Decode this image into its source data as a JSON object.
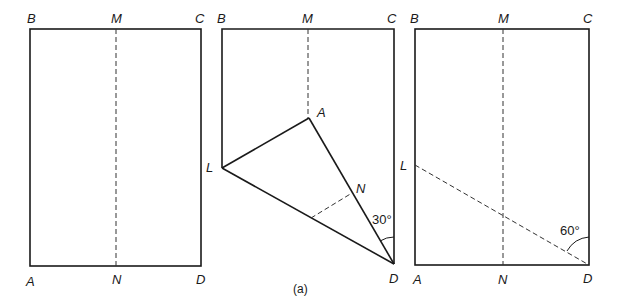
{
  "figure": {
    "caption": "(a)",
    "panels": [
      {
        "id": "panel-1",
        "labels": {
          "B": "B",
          "M": "M",
          "C": "C",
          "A": "A",
          "N": "N",
          "D": "D"
        }
      },
      {
        "id": "panel-2",
        "labels": {
          "B": "B",
          "M": "M",
          "C": "C",
          "A": "A",
          "L": "L",
          "N": "N",
          "D": "D"
        },
        "angle": "30°"
      },
      {
        "id": "panel-3",
        "labels": {
          "B": "B",
          "M": "M",
          "C": "C",
          "L": "L",
          "A": "A",
          "N": "N",
          "D": "D"
        },
        "angle": "60°"
      }
    ]
  }
}
